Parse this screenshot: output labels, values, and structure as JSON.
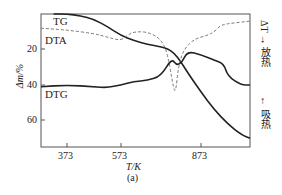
{
  "chart_data": {
    "type": "line",
    "title": "",
    "caption": "(a)",
    "xlabel": "T/K",
    "ylabel": "Δm/%",
    "right_axis_label": {
      "top": "放热",
      "middle": "ΔT",
      "bottom": "吸热",
      "arrow_up_text": "ΔT → 放热",
      "arrow_down_text": "← 吸热"
    },
    "x_ticks": [
      373,
      573,
      873
    ],
    "y_ticks": [
      20,
      40,
      60
    ],
    "xlim": [
      273,
      1073
    ],
    "ylim": [
      0,
      75
    ],
    "y_inverted": true,
    "grid": false,
    "legend_position": "inline curve labels",
    "series": [
      {
        "name": "TG",
        "style": "solid",
        "x": [
          323,
          373,
          423,
          473,
          523,
          573,
          623,
          673,
          723,
          748,
          773,
          798,
          823,
          873,
          923,
          973,
          1023,
          1063
        ],
        "y": [
          0,
          0,
          1,
          3,
          7,
          12,
          15,
          17,
          18.5,
          19.5,
          22,
          27,
          33,
          44,
          54,
          62,
          68,
          70
        ]
      },
      {
        "name": "DTA",
        "style": "dashed",
        "x": [
          273,
          373,
          473,
          523,
          573,
          598,
          623,
          673,
          723,
          748,
          768,
          778,
          788,
          808,
          848,
          898,
          923,
          948,
          998,
          1063
        ],
        "y": [
          8,
          9,
          11,
          13,
          15,
          12,
          10,
          10,
          14,
          22,
          40,
          45,
          30,
          20,
          14,
          12,
          10,
          6,
          5,
          4
        ]
      },
      {
        "name": "DTG",
        "style": "solid",
        "x": [
          273,
          373,
          473,
          523,
          573,
          623,
          673,
          723,
          763,
          783,
          803,
          823,
          873,
          923,
          958,
          973,
          1023,
          1063
        ],
        "y": [
          41,
          40,
          41,
          41.5,
          40,
          38,
          37.5,
          35,
          25,
          29,
          27,
          21,
          23,
          26,
          28,
          35,
          40,
          40
        ]
      }
    ]
  }
}
